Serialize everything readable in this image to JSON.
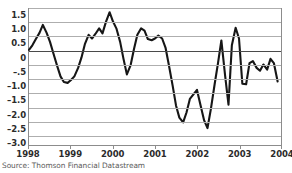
{
  "chart_data": {
    "type": "line",
    "title": "",
    "subtitle": "",
    "xlabel": "",
    "ylabel": "",
    "source": "Source: Thomson Financial Datastream",
    "grid": true,
    "legend": false,
    "legend_position": "none",
    "line_color": "#161616",
    "grid_color": "#aeaeae",
    "zero_line_color": "#4a4a4a",
    "axis_color": "#8c8c8c",
    "xlim": [
      1998.0,
      2004.0
    ],
    "ylim": [
      -3.35,
      1.5
    ],
    "ytick_labels": [
      "1.5",
      "1.0",
      "0.5",
      "0",
      "–.5",
      "–1.0",
      "–1.5",
      "–2.0",
      "–2.5",
      "–3.0"
    ],
    "ytick_values": [
      1.5,
      1.0,
      0.5,
      0.0,
      -0.5,
      -1.0,
      -1.5,
      -2.0,
      -2.5,
      -3.0
    ],
    "xtick_labels": [
      "1998",
      "1999",
      "2000",
      "2001",
      "2002",
      "2003",
      "2004"
    ],
    "xtick_values": [
      1998,
      1999,
      2000,
      2001,
      2002,
      2003,
      2004
    ],
    "series": [
      {
        "name": "series-1",
        "x": [
          1998.0,
          1998.08,
          1998.17,
          1998.25,
          1998.33,
          1998.42,
          1998.5,
          1998.58,
          1998.67,
          1998.75,
          1998.83,
          1998.92,
          1999.0,
          1999.08,
          1999.17,
          1999.25,
          1999.33,
          1999.42,
          1999.5,
          1999.58,
          1999.67,
          1999.75,
          1999.83,
          1999.92,
          2000.0,
          2000.08,
          2000.17,
          2000.25,
          2000.33,
          2000.42,
          2000.5,
          2000.58,
          2000.67,
          2000.75,
          2000.83,
          2000.92,
          2001.0,
          2001.08,
          2001.17,
          2001.25,
          2001.33,
          2001.42,
          2001.5,
          2001.58,
          2001.67,
          2001.75,
          2001.83,
          2001.92,
          2002.0,
          2002.08,
          2002.17,
          2002.25,
          2002.33,
          2002.42,
          2002.5,
          2002.58,
          2002.67,
          2002.75,
          2002.83,
          2002.92,
          2003.0,
          2003.08,
          2003.17,
          2003.25,
          2003.33,
          2003.42,
          2003.5,
          2003.58,
          2003.67,
          2003.75,
          2003.83,
          2003.92
        ],
        "values": [
          0.02,
          0.18,
          0.42,
          0.62,
          0.9,
          0.62,
          0.3,
          -0.1,
          -0.55,
          -0.92,
          -1.12,
          -1.15,
          -1.05,
          -0.92,
          -0.62,
          -0.25,
          0.22,
          0.55,
          0.42,
          0.58,
          0.78,
          0.6,
          1.0,
          1.35,
          1.02,
          0.78,
          0.3,
          -0.3,
          -0.85,
          -0.52,
          0.05,
          0.55,
          0.78,
          0.7,
          0.4,
          0.36,
          0.42,
          0.52,
          0.42,
          0.1,
          -0.52,
          -1.25,
          -1.95,
          -2.38,
          -2.55,
          -2.2,
          -1.72,
          -1.55,
          -1.4,
          -1.92,
          -2.48,
          -2.75,
          -2.08,
          -1.2,
          -0.45,
          0.35,
          -0.9,
          -1.92,
          0.18,
          0.8,
          0.42,
          -1.18,
          -1.2,
          -0.45,
          -0.38,
          -0.62,
          -0.72,
          -0.5,
          -0.68,
          -0.3,
          -0.45,
          -1.1
        ]
      }
    ]
  },
  "axis": {
    "y_labels": [
      "1.5",
      "1.0",
      "0.5",
      "0",
      "–.5",
      "–1.0",
      "–1.5",
      "–2.0",
      "–2.5",
      "–3.0"
    ],
    "x_labels": [
      "1998",
      "1999",
      "2000",
      "2001",
      "2002",
      "2003",
      "2004"
    ]
  },
  "footer": {
    "source_text": "Source: Thomson Financial Datastream"
  }
}
